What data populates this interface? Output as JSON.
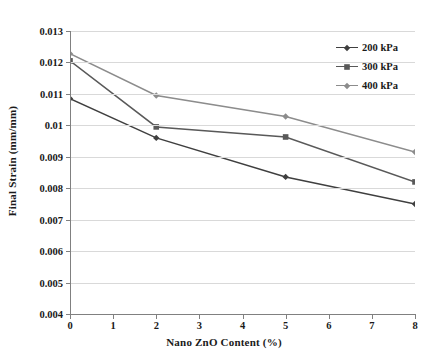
{
  "chart_data": {
    "type": "line",
    "title": "",
    "xlabel": "Nano ZnO Content (%)",
    "ylabel": "Final Strain (mm/mm)",
    "x": [
      0,
      2,
      5,
      8
    ],
    "xlim": [
      0,
      8
    ],
    "ylim": [
      0.004,
      0.013
    ],
    "xticks": [
      0,
      1,
      2,
      3,
      4,
      5,
      6,
      7,
      8
    ],
    "xticklabels": [
      "0",
      "1",
      "2",
      "3",
      "4",
      "5",
      "6",
      "7",
      "8"
    ],
    "yticks": [
      0.004,
      0.005,
      0.006,
      0.007,
      0.008,
      0.009,
      0.01,
      0.011,
      0.012,
      0.013
    ],
    "yticklabels": [
      "0.004",
      "0.005",
      "0.006",
      "0.007",
      "0.008",
      "0.009",
      "0.01",
      "0.011",
      "0.012",
      "0.013"
    ],
    "grid": "horizontal",
    "legend_position": "top-right",
    "series": [
      {
        "name": "200 kPa",
        "values": [
          0.01085,
          0.0096,
          0.00836,
          0.0075
        ],
        "color": "#3f3f3f",
        "marker": "diamond"
      },
      {
        "name": "300 kPa",
        "values": [
          0.01205,
          0.00995,
          0.00963,
          0.0082
        ],
        "color": "#595959",
        "marker": "square"
      },
      {
        "name": "400 kPa",
        "values": [
          0.01228,
          0.01095,
          0.01028,
          0.00915
        ],
        "color": "#8c8c8c",
        "marker": "diamond"
      }
    ]
  },
  "axis": {
    "x_title": "Nano ZnO Content (%)",
    "y_title": "Final Strain (mm/mm)"
  },
  "legend": {
    "items": [
      {
        "label": "200 kPa"
      },
      {
        "label": "300 kPa"
      },
      {
        "label": "400 kPa"
      }
    ]
  },
  "colors": {
    "series_200": "#3f3f3f",
    "series_300": "#595959",
    "series_400": "#8c8c8c",
    "gridline": "#d9d9d9",
    "axis": "#808080",
    "background": "#ffffff"
  }
}
